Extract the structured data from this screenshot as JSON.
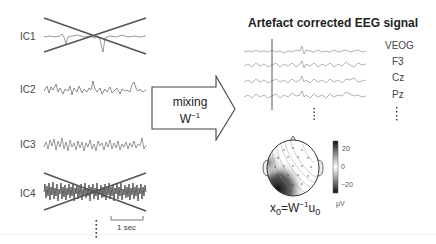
{
  "left_panel": {
    "components": [
      {
        "label": "IC1",
        "rejected": true
      },
      {
        "label": "IC2",
        "rejected": false
      },
      {
        "label": "IC3",
        "rejected": false
      },
      {
        "label": "IC4",
        "rejected": true
      }
    ],
    "ellipsis": "⋮",
    "scale_bar_label": "1 sec"
  },
  "arrow": {
    "line1": "mixing",
    "line2_base": "W",
    "line2_sup": "−1"
  },
  "right_panel": {
    "title": "Artefact corrected EEG signal",
    "channels": [
      "VEOG",
      "F3",
      "Cz",
      "Pz"
    ],
    "ellipsis": "⋮"
  },
  "topomap": {
    "colorbar_ticks": [
      "20",
      "0",
      "−20"
    ],
    "colorbar_unit": "μV"
  },
  "formula": {
    "x": "x",
    "x_sub": "0",
    "eq": "=W",
    "sup": "−1",
    "u": "u",
    "u_sub": "0"
  }
}
